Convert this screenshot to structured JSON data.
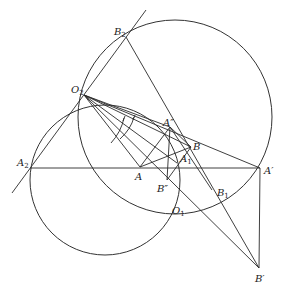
{
  "figure": {
    "type": "geometric construction",
    "line_color": "#2a2a2a"
  },
  "points": {
    "O2": {
      "label": "O",
      "sub": "2",
      "x": 84,
      "y": 95
    },
    "B2": {
      "label": "B",
      "sub": "2",
      "x": 126,
      "y": 37
    },
    "A2": {
      "label": "A",
      "sub": "2",
      "x": 30,
      "y": 168
    },
    "A": {
      "label": "A",
      "sub": "",
      "x": 140,
      "y": 167
    },
    "B": {
      "label": "B",
      "sub": "",
      "x": 191,
      "y": 147
    },
    "A_dd": {
      "label": "A″",
      "sub": "",
      "x": 170,
      "y": 127
    },
    "B_dd": {
      "label": "B″",
      "sub": "",
      "x": 167,
      "y": 180
    },
    "A1": {
      "label": "A",
      "sub": "1",
      "x": 177,
      "y": 163
    },
    "B1": {
      "label": "B",
      "sub": "1",
      "x": 212,
      "y": 190
    },
    "O1": {
      "label": "O",
      "sub": "1",
      "x": 168,
      "y": 204
    },
    "A_p": {
      "label": "A′",
      "sub": "",
      "x": 260,
      "y": 168
    },
    "B_p": {
      "label": "B′",
      "sub": "",
      "x": 259,
      "y": 268
    }
  },
  "circles": [
    {
      "name": "large-circle",
      "cx": 175,
      "cy": 117,
      "r": 97
    },
    {
      "name": "small-circle",
      "cx": 105,
      "cy": 180,
      "r": 75
    }
  ],
  "labels": {
    "O2": "O",
    "O2_sub": "2",
    "B2": "B",
    "B2_sub": "2",
    "A2": "A",
    "A2_sub": "2",
    "A": "A",
    "B": "B",
    "A_dd": "A″",
    "B_dd": "B″",
    "A1": "A",
    "A1_sub": "1",
    "B1": "B",
    "B1_sub": "1",
    "O1": "O",
    "O1_sub": "1",
    "A_p": "A′",
    "B_p": "B′"
  }
}
